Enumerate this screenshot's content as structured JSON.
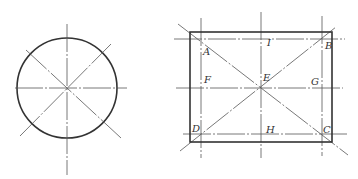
{
  "figure": {
    "left": {
      "title": "circle with centerlines",
      "circle": {
        "cx": 67,
        "cy": 88,
        "r": 50
      },
      "centerlines": [
        {
          "x1": 67,
          "y1": 24,
          "x2": 67,
          "y2": 175
        },
        {
          "x1": 15,
          "y1": 88,
          "x2": 127,
          "y2": 88
        },
        {
          "x1": 26,
          "y1": 50,
          "x2": 121,
          "y2": 138
        },
        {
          "x1": 20,
          "y1": 136,
          "x2": 111,
          "y2": 44
        }
      ]
    },
    "right": {
      "title": "rectangle with centerlines and diagonals",
      "rect": {
        "x": 190,
        "y": 32,
        "w": 142,
        "h": 110
      },
      "labels": [
        {
          "text": "A",
          "x": 203,
          "y": 55
        },
        {
          "text": "I",
          "x": 267,
          "y": 46
        },
        {
          "text": "B",
          "x": 325,
          "y": 49
        },
        {
          "text": "F",
          "x": 204,
          "y": 83
        },
        {
          "text": "E",
          "x": 263,
          "y": 81
        },
        {
          "text": "G",
          "x": 311,
          "y": 85
        },
        {
          "text": "D",
          "x": 192,
          "y": 132
        },
        {
          "text": "H",
          "x": 266,
          "y": 133
        },
        {
          "text": "C",
          "x": 323,
          "y": 133
        }
      ],
      "centerlines": [
        {
          "x1": 201,
          "y1": 18,
          "x2": 201,
          "y2": 158
        },
        {
          "x1": 261,
          "y1": 12,
          "x2": 261,
          "y2": 158
        },
        {
          "x1": 322,
          "y1": 16,
          "x2": 322,
          "y2": 156
        },
        {
          "x1": 174,
          "y1": 39,
          "x2": 345,
          "y2": 39
        },
        {
          "x1": 176,
          "y1": 88,
          "x2": 343,
          "y2": 88
        },
        {
          "x1": 183,
          "y1": 134,
          "x2": 347,
          "y2": 134
        },
        {
          "x1": 178,
          "y1": 24,
          "x2": 348,
          "y2": 155
        },
        {
          "x1": 180,
          "y1": 151,
          "x2": 336,
          "y2": 27
        }
      ]
    }
  }
}
